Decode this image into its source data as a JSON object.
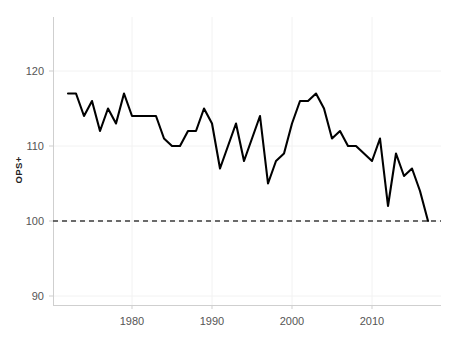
{
  "chart_data": {
    "type": "line",
    "title": "",
    "subtitle": "",
    "xlabel": "",
    "ylabel": "OPS+",
    "xlim": [
      1972,
      2017
    ],
    "ylim": [
      88,
      123
    ],
    "grid": true,
    "legend": false,
    "x_ticks": [
      1980,
      1990,
      2000,
      2010
    ],
    "x_tick_labels": [
      "1980",
      "1990",
      "2000",
      "2010"
    ],
    "y_ticks": [
      90,
      100,
      110,
      120
    ],
    "y_tick_labels": [
      "90",
      "100",
      "110",
      "120"
    ],
    "reference_line": {
      "axis": "y",
      "value": 100,
      "style": "dashed",
      "color": "#3b3b3b",
      "label": ""
    },
    "line_color": "#000000",
    "series": [
      {
        "name": "OPS+",
        "x": [
          1972,
          1973,
          1974,
          1975,
          1976,
          1977,
          1978,
          1979,
          1980,
          1981,
          1982,
          1983,
          1984,
          1985,
          1986,
          1987,
          1988,
          1989,
          1990,
          1991,
          1992,
          1993,
          1994,
          1995,
          1996,
          1997,
          1998,
          1999,
          2000,
          2001,
          2002,
          2003,
          2004,
          2005,
          2006,
          2007,
          2008,
          2009,
          2010,
          2011,
          2012,
          2013,
          2014,
          2015,
          2016,
          2017
        ],
        "values": [
          117,
          117,
          114,
          116,
          112,
          115,
          113,
          117,
          114,
          114,
          114,
          114,
          111,
          110,
          110,
          112,
          112,
          115,
          113,
          107,
          110,
          113,
          108,
          111,
          114,
          105,
          108,
          109,
          113,
          116,
          116,
          117,
          115,
          111,
          112,
          110,
          110,
          109,
          108,
          111,
          102,
          109,
          106,
          107,
          104,
          100
        ]
      }
    ],
    "annotations": []
  },
  "axis": {
    "y_title": "OPS+"
  }
}
